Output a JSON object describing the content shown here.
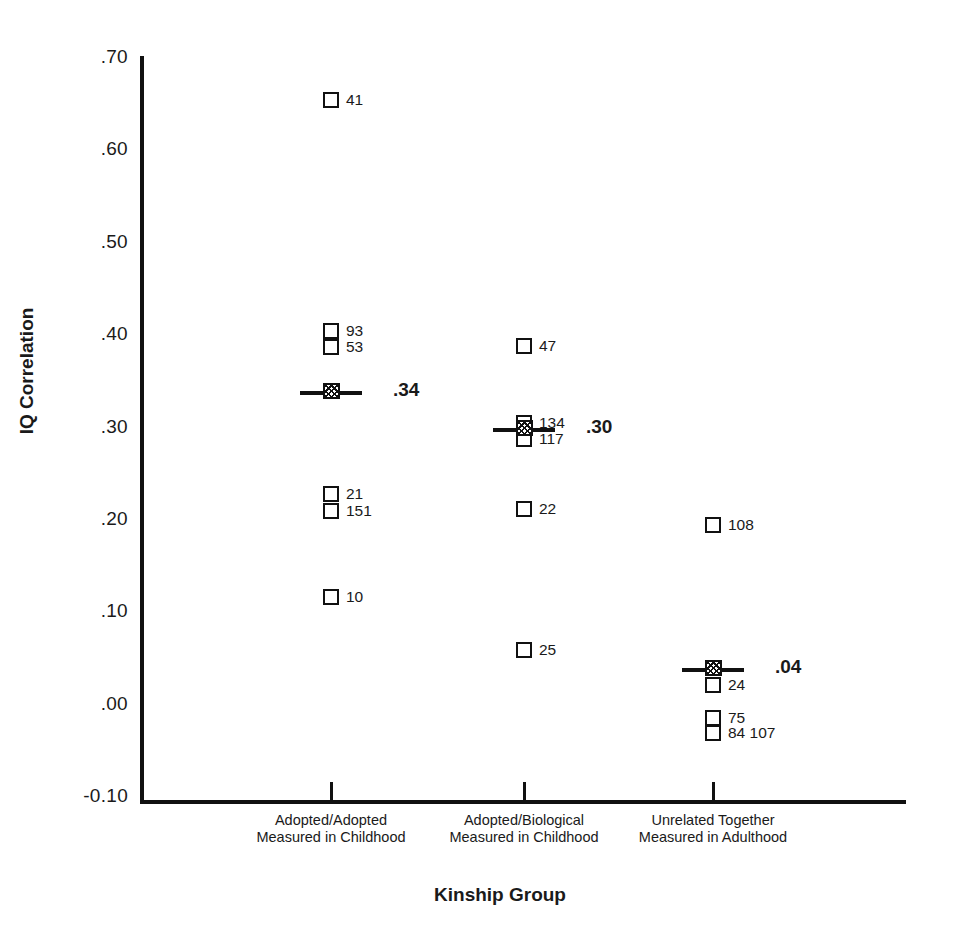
{
  "chart_data": {
    "type": "scatter",
    "title": "",
    "xlabel": "Kinship Group",
    "ylabel": "IQ Correlation",
    "ylim": [
      -0.1,
      0.7
    ],
    "ytick_labels": [
      ".70",
      ".60",
      ".50",
      ".40",
      ".30",
      ".20",
      ".10",
      ".00",
      "-0.10"
    ],
    "ytick_values": [
      0.7,
      0.6,
      0.5,
      0.4,
      0.3,
      0.2,
      0.1,
      0.0,
      -0.1
    ],
    "grid": false,
    "legend": "none",
    "categories": [
      "Adopted/Adopted\nMeasured in Childhood",
      "Adopted/Biological\nMeasured in Childhood",
      "Unrelated Together\nMeasured in Adulthood"
    ],
    "groups": [
      {
        "name": "Adopted/Adopted Measured in Childhood",
        "label_line1": "Adopted/Adopted",
        "label_line2": "Measured in Childhood",
        "mean": 0.34,
        "mean_label": ".34",
        "points": [
          {
            "value": 0.655,
            "label": "41"
          },
          {
            "value": 0.405,
            "label": "93"
          },
          {
            "value": 0.387,
            "label": "53"
          },
          {
            "value": 0.228,
            "label": "21"
          },
          {
            "value": 0.21,
            "label": "151"
          },
          {
            "value": 0.117,
            "label": "10"
          }
        ]
      },
      {
        "name": "Adopted/Biological Measured in Childhood",
        "label_line1": "Adopted/Biological",
        "label_line2": "Measured in Childhood",
        "mean": 0.3,
        "mean_label": ".30",
        "points": [
          {
            "value": 0.388,
            "label": "47"
          },
          {
            "value": 0.305,
            "label": "134"
          },
          {
            "value": 0.288,
            "label": "117"
          },
          {
            "value": 0.212,
            "label": "22"
          },
          {
            "value": 0.059,
            "label": "25"
          }
        ]
      },
      {
        "name": "Unrelated Together Measured in Adulthood",
        "label_line1": "Unrelated Together",
        "label_line2": "Measured in Adulthood",
        "mean": 0.04,
        "mean_label": ".04",
        "points": [
          {
            "value": 0.194,
            "label": "108"
          },
          {
            "value": 0.021,
            "label": "24"
          },
          {
            "value": -0.014,
            "label": "75"
          },
          {
            "value": -0.031,
            "label": "84  107"
          }
        ]
      }
    ]
  }
}
